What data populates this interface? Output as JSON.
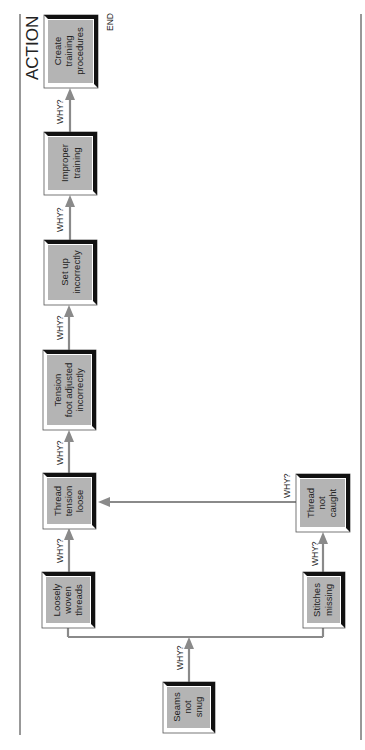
{
  "diagram": {
    "title": "ACTION",
    "end_label": "END",
    "why_label": "WHY?",
    "orientation": "rotated 90 degrees counterclockwise",
    "nodes": [
      {
        "id": "seams",
        "lines": [
          "Seams",
          "not",
          "snug"
        ]
      },
      {
        "id": "loosely",
        "lines": [
          "Loosely",
          "woven",
          "threads"
        ]
      },
      {
        "id": "stitches",
        "lines": [
          "Stitches",
          "missing"
        ]
      },
      {
        "id": "threadnot",
        "lines": [
          "Thread",
          "not",
          "caught"
        ]
      },
      {
        "id": "tension",
        "lines": [
          "Thread",
          "tension",
          "loose"
        ]
      },
      {
        "id": "foot",
        "lines": [
          "Tension",
          "foot adjusted",
          "incorrectly"
        ]
      },
      {
        "id": "setup",
        "lines": [
          "Set up",
          "incorrectly"
        ]
      },
      {
        "id": "improper",
        "lines": [
          "Improper",
          "training"
        ]
      },
      {
        "id": "create",
        "lines": [
          "Create",
          "training",
          "procedures"
        ]
      }
    ],
    "edges": [
      {
        "from": "seams",
        "to": "loosely",
        "label": "WHY?"
      },
      {
        "from": "seams",
        "to": "stitches",
        "label": "WHY?"
      },
      {
        "from": "loosely",
        "to": "tension",
        "label": "WHY?"
      },
      {
        "from": "stitches",
        "to": "threadnot",
        "label": "WHY?"
      },
      {
        "from": "threadnot",
        "to": "tension",
        "label": "WHY?"
      },
      {
        "from": "tension",
        "to": "foot",
        "label": "WHY?"
      },
      {
        "from": "foot",
        "to": "setup",
        "label": "WHY?"
      },
      {
        "from": "setup",
        "to": "improper",
        "label": "WHY?"
      },
      {
        "from": "improper",
        "to": "create",
        "label": "WHY?"
      }
    ],
    "colors": {
      "box_fill": "#b4b4b4",
      "box_shadow": "#111111",
      "arrow": "#8a8a8a"
    }
  }
}
